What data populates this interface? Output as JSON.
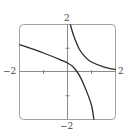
{
  "chart_data": {
    "type": "line",
    "title": "",
    "xlabel": "",
    "ylabel": "",
    "xlim": [
      -2,
      2
    ],
    "ylim": [
      -2,
      2
    ],
    "grid": false,
    "legend": null,
    "x_ticks": [
      -2,
      -1,
      0,
      1,
      2
    ],
    "y_ticks": [
      -2,
      -1,
      0,
      1,
      2
    ],
    "tick_labels": {
      "x_left": "−2",
      "x_right": "2",
      "y_top": "2",
      "y_bottom": "−2"
    },
    "series": [
      {
        "name": "left-branch",
        "points": [
          [
            -2.0,
            1.15
          ],
          [
            -1.5,
            0.98
          ],
          [
            -1.0,
            0.8
          ],
          [
            -0.5,
            0.6
          ],
          [
            0.0,
            0.38
          ],
          [
            0.25,
            0.2
          ],
          [
            0.5,
            -0.15
          ],
          [
            0.75,
            -0.7
          ],
          [
            1.0,
            -1.4
          ],
          [
            1.1,
            -2.0
          ]
        ]
      },
      {
        "name": "right-branch",
        "points": [
          [
            0.12,
            2.0
          ],
          [
            0.25,
            1.55
          ],
          [
            0.5,
            0.95
          ],
          [
            0.75,
            0.62
          ],
          [
            1.0,
            0.42
          ],
          [
            1.5,
            0.22
          ],
          [
            2.0,
            0.1
          ]
        ]
      }
    ],
    "colors": {
      "curve": "#2a2a2a",
      "axis": "#8a8a8a",
      "frame": "#9a9a9a"
    }
  }
}
